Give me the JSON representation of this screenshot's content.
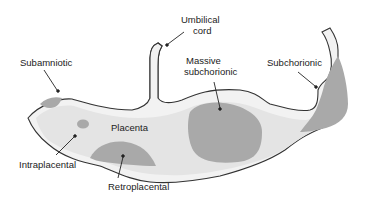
{
  "diagram": {
    "type": "anatomical-schematic",
    "colors": {
      "outline": "#333333",
      "membrane": "#f2f2f2",
      "placenta": "#e4e4e4",
      "hematoma": "#a9a9a9",
      "text": "#222222"
    },
    "labels": {
      "subamniotic": "Subamniotic",
      "umbilical_line1": "Umbilical",
      "umbilical_line2": "cord",
      "massive_line1": "Massive",
      "massive_line2": "subchorionic",
      "subchorionic": "Subchorionic",
      "placenta": "Placenta",
      "intraplacental": "Intraplacental",
      "retroplacental": "Retroplacental"
    }
  }
}
